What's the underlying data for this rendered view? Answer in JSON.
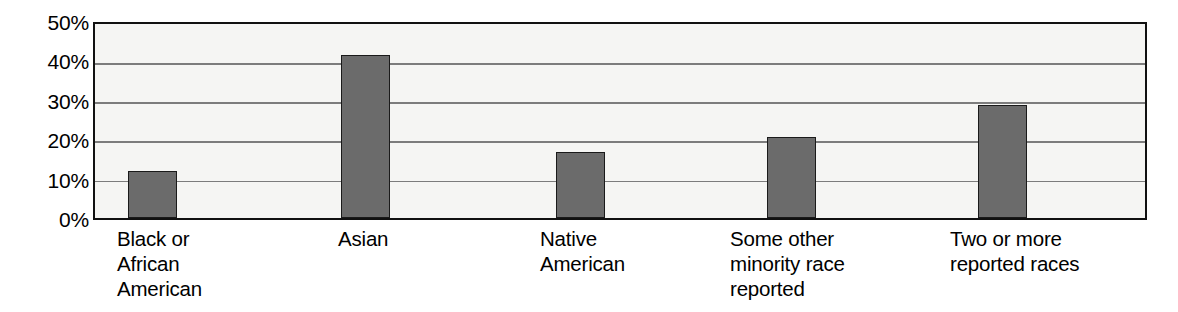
{
  "chart_data": {
    "type": "bar",
    "title": "",
    "xlabel": "",
    "ylabel": "",
    "categories": [
      "Black or\nAfrican\nAmerican",
      "Asian",
      "Native\nAmerican",
      "Some other\nminority race\nreported",
      "Two or more\nreported races"
    ],
    "values": [
      12,
      42,
      17,
      21,
      29
    ],
    "ylim": [
      0,
      50
    ],
    "ytick_labels": [
      "50%",
      "40%",
      "30%",
      "20%",
      "10%",
      "0%"
    ],
    "ytick_values": [
      50,
      40,
      30,
      20,
      10,
      0
    ],
    "grid": true,
    "legend": "none",
    "value_format": "percent",
    "colors": {
      "bar_fill": "#6b6b6b",
      "bar_border": "#1a1a1a",
      "plot_background": "#f5f5f3",
      "plot_border": "#111111",
      "gridline": "#7c7c7c",
      "text": "#000000",
      "page_background": "#ffffff"
    }
  }
}
